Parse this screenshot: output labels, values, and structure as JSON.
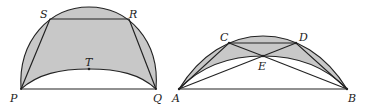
{
  "colors": {
    "fill": "#c8c8c8",
    "stroke": "#222222",
    "background": "#ffffff"
  },
  "figures": [
    {
      "id": "left",
      "labels": {
        "P": "P",
        "Q": "Q",
        "R": "R",
        "S": "S",
        "T": "T"
      }
    },
    {
      "id": "right",
      "labels": {
        "A": "A",
        "B": "B",
        "C": "C",
        "D": "D",
        "E": "E"
      }
    }
  ]
}
